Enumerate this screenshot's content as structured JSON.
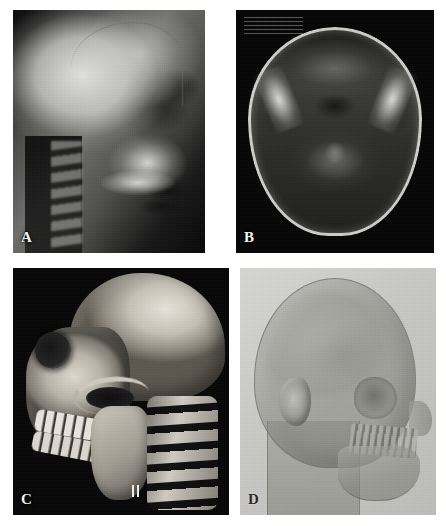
{
  "figure": {
    "kind": "medical-imaging-figure",
    "layout": "2x2 panel montage",
    "background_color": "#ffffff",
    "panel_count": 4,
    "panels": [
      {
        "id": "a",
        "label": "A",
        "label_color": "#f2f2f2",
        "label_position": "bottom-left",
        "background_color": "#070707",
        "modality": "lateral cephalometric radiograph",
        "view": "lateral",
        "anatomy": "skull, facial skeleton, maxillary sinus, cervical spine",
        "image_tone": "grayscale film"
      },
      {
        "id": "b",
        "label": "B",
        "label_color": "#f2f2f2",
        "label_position": "bottom-left",
        "background_color": "#050505",
        "modality": "axial MRI",
        "view": "axial",
        "anatomy": "skull base, temporal bones, vertebral body, spinal canal",
        "image_tone": "grayscale",
        "scanner_annotation": "illegible overlay text top-left"
      },
      {
        "id": "c",
        "label": "C",
        "label_color": "#f2f2f2",
        "label_position": "bottom-left",
        "background_color": "#050505",
        "modality": "3D CT volume rendering, bone window",
        "view": "oblique lateral",
        "anatomy": "cranium, orbit, zygomatic arch, maxilla, mandible, dentition, cervical vertebrae",
        "image_tone": "bone-tan surface render"
      },
      {
        "id": "d",
        "label": "D",
        "label_color": "#2a2a2a",
        "label_position": "bottom-left",
        "background_color": "#c9c9c5",
        "modality": "3D CT volume rendering, semi-transparent soft tissue over bone",
        "view": "oblique lateral",
        "anatomy": "skin surface, ear, skull, orbit, maxilla, mandible, dentition, neck",
        "image_tone": "translucent gray"
      }
    ]
  }
}
